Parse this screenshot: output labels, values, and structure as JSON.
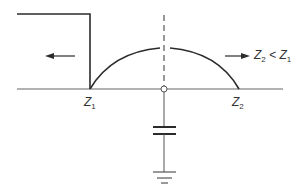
{
  "diagram": {
    "labels": {
      "z1": {
        "base": "Z",
        "sub": "1"
      },
      "z2": {
        "base": "Z",
        "sub": "2"
      },
      "condition": {
        "a_base": "Z",
        "a_sub": "2",
        "op": " < ",
        "b_base": "Z",
        "b_sub": "1"
      }
    },
    "elements": [
      "transmission-line",
      "incident-step-wave",
      "reflected-arrow-left",
      "transmitted-arrow-right",
      "junction-node",
      "shunt-capacitor",
      "ground-symbol",
      "dashed-junction-line"
    ],
    "colors": {
      "line": "#2b2b2b",
      "baseline": "#555555",
      "dashed": "#555555"
    }
  }
}
